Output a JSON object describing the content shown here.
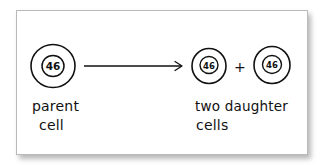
{
  "diagram": {
    "type": "cell-division",
    "colors": {
      "ink": "#111111",
      "card_border": "#b9b9b9",
      "background": "#ffffff"
    },
    "parent_cell": {
      "chromosome_count": "46",
      "label_line1": "parent",
      "label_line2": "cell"
    },
    "arrow": {
      "icon": "right-arrow-icon"
    },
    "daughter_cells": [
      {
        "chromosome_count": "46"
      },
      {
        "chromosome_count": "46"
      }
    ],
    "plus_sign": "+",
    "daughter_label_line1": "two daughter",
    "daughter_label_line2": "cells"
  }
}
